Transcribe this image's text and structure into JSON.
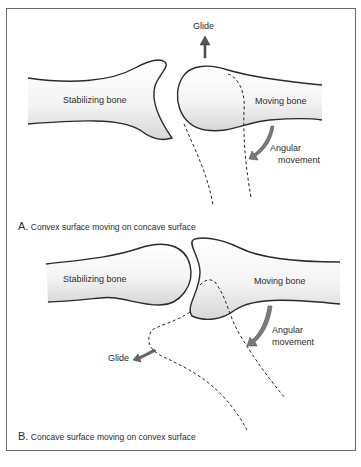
{
  "panel_a": {
    "glide_label": "Glide",
    "stabilizing_label": "Stabilizing bone",
    "moving_label": "Moving bone",
    "angular_label_1": "Angular",
    "angular_label_2": "movement",
    "caption_letter": "A.",
    "caption_text": "Convex surface moving on concave surface"
  },
  "panel_b": {
    "glide_label": "Glide",
    "stabilizing_label": "Stabilizing bone",
    "moving_label": "Moving bone",
    "angular_label_1": "Angular",
    "angular_label_2": "movement",
    "caption_letter": "B.",
    "caption_text": "Concave surface moving on convex surface"
  },
  "colors": {
    "outline": "#2a2a2a",
    "shade": "#d9d9d9",
    "arrow": "#6b6b6b"
  }
}
